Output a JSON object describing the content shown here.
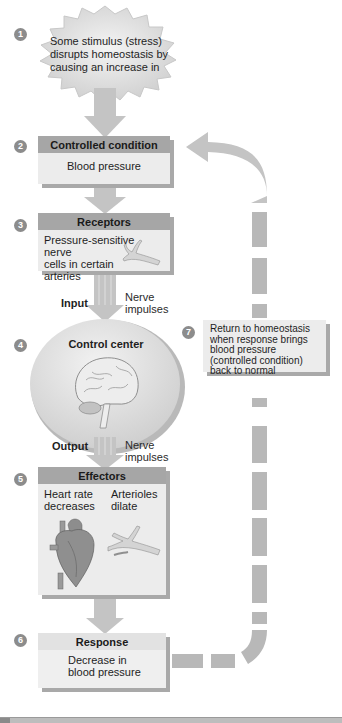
{
  "diagram": {
    "topic": "Negative feedback regulation of blood pressure",
    "steps": [
      {
        "num": "1",
        "text": "Some stimulus (stress) disrupts homeostasis by causing an increase in"
      },
      {
        "num": "2",
        "title": "Controlled condition",
        "text": "Blood pressure"
      },
      {
        "num": "3",
        "title": "Receptors",
        "text_lines": [
          "Pressure-sensitive nerve",
          "cells in certain",
          "arteries"
        ]
      },
      {
        "num": "4",
        "title": "Control center"
      },
      {
        "num": "5",
        "title": "Effectors",
        "left_lines": [
          "Heart rate",
          "decreases"
        ],
        "right_lines": [
          "Arterioles",
          "dilate"
        ]
      },
      {
        "num": "6",
        "title": "Response",
        "text_lines": [
          "Decrease in",
          "blood pressure"
        ]
      },
      {
        "num": "7",
        "text_lines": [
          "Return to homeostasis",
          "when response brings",
          "blood pressure",
          "(controlled condition)",
          "back to normal"
        ]
      }
    ],
    "input": {
      "label": "Input",
      "signal_lines": [
        "Nerve",
        "impulses"
      ]
    },
    "output": {
      "label": "Output",
      "signal_lines": [
        "Nerve",
        "impulses"
      ]
    },
    "icons": [
      "brain-icon",
      "artery-icon",
      "heart-icon",
      "arterioles-icon"
    ],
    "colors": {
      "box_fill": "#ececec",
      "header_fill": "#a6a6a6",
      "arrow_fill": "#c4c4c4",
      "feedback_dash": "#b8b8b8",
      "badge": "#8c8c8c",
      "ellipse": "#dcdcdc"
    }
  }
}
